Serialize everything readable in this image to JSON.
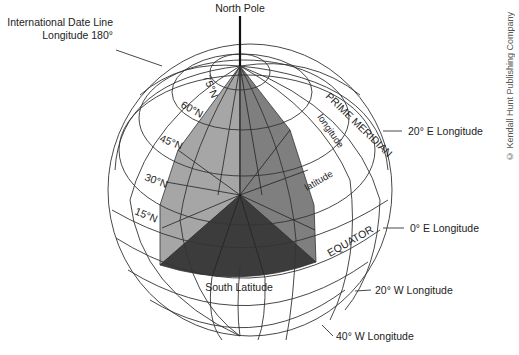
{
  "diagram": {
    "labels": {
      "north_pole": "North Pole",
      "date_line_line1": "International Date Line",
      "date_line_line2": "Longitude 180°",
      "prime_meridian": "PRIME MERIDIAN",
      "longitude": "longitude",
      "latitude": "latitude",
      "equator": "EQUATOR",
      "south_latitude": "South Latitude",
      "lon_20e": "20° E Longitude",
      "lon_0e": "0° E Longitude",
      "lon_20w": "20° W Longitude",
      "lon_40w": "40° W Longitude"
    },
    "parallels": [
      "75°N",
      "60°N",
      "45°N",
      "30°N",
      "15°N"
    ],
    "copyright": "© Kendall Hunt Publishing Company",
    "colors": {
      "light_wedge": "#a6a6a6",
      "mid_wedge": "#7f7f7f",
      "dark_wedge": "#3c3c3c",
      "grid": "#333333",
      "background": "#ffffff"
    }
  }
}
